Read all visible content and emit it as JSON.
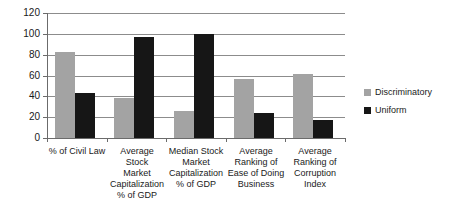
{
  "chart_data": {
    "type": "bar",
    "title": "",
    "xlabel": "",
    "ylabel": "",
    "ylim": [
      0,
      120
    ],
    "yticks": [
      0,
      20,
      40,
      60,
      80,
      100,
      120
    ],
    "grid": true,
    "legend_position": "right",
    "categories": [
      "% of Civil Law",
      "Average Stock Market Capitalization % of GDP",
      "Median Stock Market Capitalization % of GDP",
      "Average Ranking of Ease of Doing Business",
      "Average Ranking of Corruption Index"
    ],
    "category_lines": [
      [
        "% of Civil Law"
      ],
      [
        "Average",
        "Stock",
        "Market",
        "Capitalization",
        "% of GDP"
      ],
      [
        "Median Stock",
        "Market",
        "Capitalization",
        "% of GDP"
      ],
      [
        "Average",
        "Ranking of",
        "Ease of Doing",
        "Business"
      ],
      [
        "Average",
        "Ranking of",
        "Corruption",
        "Index"
      ]
    ],
    "series": [
      {
        "name": "Discriminatory",
        "color": "#a3a3a3",
        "values": [
          83,
          38,
          26,
          57,
          61
        ]
      },
      {
        "name": "Uniform",
        "color": "#161616",
        "values": [
          43,
          97,
          100,
          24,
          17
        ]
      }
    ]
  },
  "legend": {
    "items": [
      {
        "label": "Discriminatory"
      },
      {
        "label": "Uniform"
      }
    ]
  }
}
